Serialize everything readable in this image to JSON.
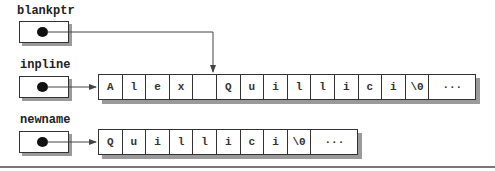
{
  "pointers": {
    "blankptr": {
      "label": "blankptr"
    },
    "inpline": {
      "label": "inpline"
    },
    "newname": {
      "label": "newname"
    }
  },
  "arrays": {
    "inpline": {
      "cells": [
        "A",
        "l",
        "e",
        "x",
        " ",
        "Q",
        "u",
        "i",
        "l",
        "l",
        "i",
        "c",
        "i",
        "\\0",
        "···"
      ]
    },
    "newname": {
      "cells": [
        "Q",
        "u",
        "i",
        "l",
        "l",
        "i",
        "c",
        "i",
        "\\0",
        "···"
      ]
    }
  },
  "colors": {
    "stroke": "#333333",
    "shadow": "#9a9a9a",
    "arrow": "#444444"
  }
}
